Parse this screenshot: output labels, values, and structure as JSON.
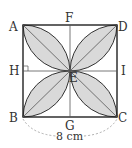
{
  "figure": {
    "points": {
      "A": "A",
      "B": "B",
      "C": "C",
      "D": "D",
      "E": "E",
      "F": "F",
      "G": "G",
      "H": "H",
      "I": "I"
    },
    "dimension_label": "8 cm",
    "colors": {
      "petal_fill": "#d9d9d9",
      "stroke": "#333333",
      "dimension_arc": "#999999"
    }
  }
}
